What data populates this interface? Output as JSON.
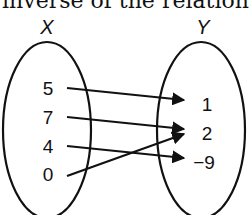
{
  "caption": "inverse of the relation",
  "diagram": {
    "type": "mapping-diagram",
    "domain_label": "X",
    "range_label": "Y",
    "domain": [
      "5",
      "7",
      "4",
      "0"
    ],
    "range": [
      "1",
      "2",
      "−9"
    ],
    "mappings": [
      {
        "from": "5",
        "to": "1"
      },
      {
        "from": "7",
        "to": "2"
      },
      {
        "from": "4",
        "to": "−9"
      },
      {
        "from": "0",
        "to": "2"
      }
    ],
    "colors": {
      "stroke": "#111111",
      "background": "#ffffff"
    }
  }
}
